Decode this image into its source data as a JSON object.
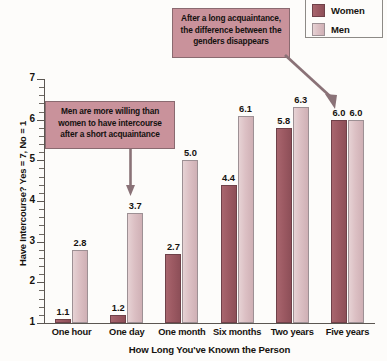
{
  "chart_data": {
    "type": "bar",
    "title": "",
    "xlabel": "How Long You've Known the Person",
    "ylabel": "Have Intercourse? Yes = 7, No = 1",
    "categories": [
      "One hour",
      "One day",
      "One month",
      "Six months",
      "Two years",
      "Five years"
    ],
    "series": [
      {
        "name": "Women",
        "color": "#9d5a63",
        "values": [
          1.1,
          1.2,
          2.7,
          4.4,
          5.8,
          6.0
        ]
      },
      {
        "name": "Men",
        "color": "#dcc0c4",
        "values": [
          2.8,
          3.7,
          5.0,
          6.1,
          6.3,
          6.0
        ]
      }
    ],
    "ylim": [
      1,
      7
    ],
    "yticks": [
      1,
      2,
      3,
      4,
      5,
      6,
      7
    ],
    "ytick_labels": [
      "1",
      "2",
      "3",
      "4",
      "5",
      "6",
      "7"
    ],
    "minor_ticks_per_interval": 4,
    "grid": false,
    "legend_position": "top-right",
    "annotations": [
      {
        "id": "long-acquaintance",
        "text": "After a long acquaintance, the difference between the genders disappears",
        "points_to": "Five years"
      },
      {
        "id": "short-acquaintance",
        "text": "Men are more willing than women to have intercourse after a short acquaintance",
        "points_to": "One day"
      }
    ]
  },
  "legend": {
    "items": [
      {
        "label": "Women",
        "color": "#9d5a63"
      },
      {
        "label": "Men",
        "color": "#dcc0c4"
      }
    ]
  },
  "callouts": {
    "long": {
      "line1": "After a long acquaintance,",
      "line2": "the difference between the",
      "line3": "genders disappears"
    },
    "short": {
      "line1": "Men are more willing than",
      "line2": "women to have intercourse",
      "line3": "after a short acquaintance"
    }
  },
  "axes": {
    "y_title": "Have Intercourse? Yes = 7, No = 1",
    "x_title": "How Long You've Known the Person",
    "y_labels": [
      "7",
      "6",
      "5",
      "4",
      "3",
      "2",
      "1"
    ]
  },
  "values_text": {
    "women": [
      "1.1",
      "1.2",
      "2.7",
      "4.4",
      "5.8",
      "6.0"
    ],
    "men": [
      "2.8",
      "3.7",
      "5.0",
      "6.1",
      "6.3",
      "6.0"
    ]
  }
}
